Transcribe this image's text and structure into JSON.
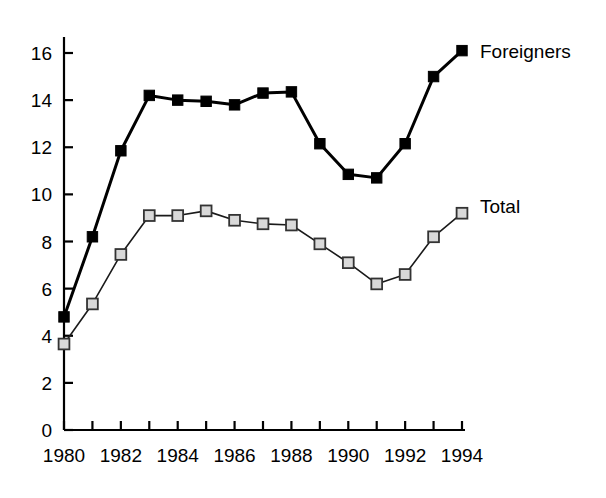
{
  "chart_data": {
    "type": "line",
    "title": "",
    "subtitle": "",
    "xlabel": "",
    "ylabel": "",
    "xlim": [
      1980,
      1994
    ],
    "ylim": [
      0,
      16
    ],
    "grid": false,
    "legend_position": "right-inline",
    "x": [
      1980,
      1981,
      1982,
      1983,
      1984,
      1985,
      1986,
      1987,
      1988,
      1989,
      1990,
      1991,
      1992,
      1993,
      1994
    ],
    "x_tick_labels": [
      "1980",
      "1982",
      "1984",
      "1986",
      "1988",
      "1990",
      "1992",
      "1994"
    ],
    "x_tick_values": [
      1980,
      1982,
      1984,
      1986,
      1988,
      1990,
      1992,
      1994
    ],
    "x_minor_ticks": [
      1981,
      1983,
      1985,
      1987,
      1989,
      1991,
      1993
    ],
    "y_tick_labels": [
      "0",
      "2",
      "4",
      "6",
      "8",
      "10",
      "12",
      "14",
      "16"
    ],
    "y_tick_values": [
      0,
      2,
      4,
      6,
      8,
      10,
      12,
      14,
      16
    ],
    "series": [
      {
        "name": "Foreigners",
        "marker": "filled-square",
        "marker_color": "#000000",
        "line_color": "#000000",
        "line_width": 3,
        "values": [
          4.8,
          8.2,
          11.85,
          14.2,
          14.0,
          13.95,
          13.8,
          14.3,
          14.35,
          12.15,
          10.85,
          10.7,
          12.15,
          15.0,
          16.1
        ]
      },
      {
        "name": "Total",
        "marker": "open-square",
        "marker_color": "#d9d9d9",
        "marker_edge_color": "#333333",
        "line_color": "#1a1a1a",
        "line_width": 1.6,
        "values": [
          3.65,
          5.35,
          7.45,
          9.1,
          9.1,
          9.3,
          8.9,
          8.75,
          8.7,
          7.9,
          7.1,
          6.2,
          6.6,
          8.2,
          9.2
        ]
      }
    ],
    "annotations": [
      {
        "text": "Foreigners",
        "x": 1994.4,
        "y": 16.1
      },
      {
        "text": "Total",
        "x": 1994.4,
        "y": 9.5
      }
    ]
  },
  "labels": {
    "series_foreigners": "Foreigners",
    "series_total": "Total"
  }
}
